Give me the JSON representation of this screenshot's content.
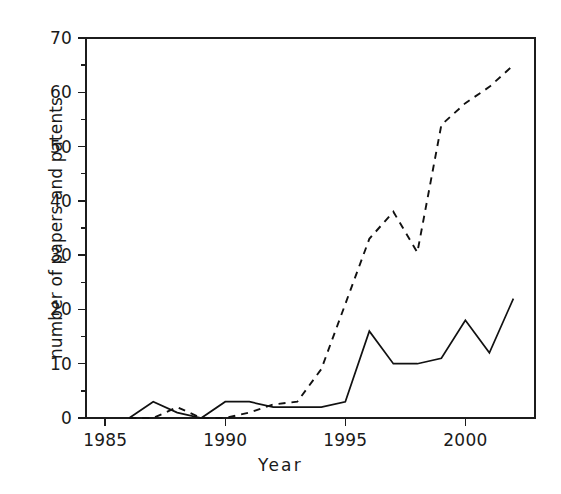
{
  "chart_data": {
    "type": "line",
    "title": "",
    "xlabel": "Year",
    "ylabel": "number of papers and patents",
    "xlim": [
      1984.2,
      2002.9
    ],
    "ylim": [
      0,
      70
    ],
    "grid": false,
    "legend": "none",
    "x_ticks": [
      1985,
      1990,
      1995,
      2000
    ],
    "x_tick_labels": [
      "1985",
      "1990",
      "1995",
      "2000"
    ],
    "x_minor_ticks": [],
    "y_ticks": [
      0,
      10,
      20,
      30,
      40,
      50,
      60,
      70
    ],
    "y_tick_labels": [
      "0",
      "10",
      "20",
      "30",
      "40",
      "50",
      "60",
      "70"
    ],
    "y_minor_ticks": [
      5,
      15,
      25,
      35,
      45,
      55,
      65
    ],
    "x": [
      1986,
      1987,
      1988,
      1989,
      1990,
      1991,
      1992,
      1993,
      1994,
      1995,
      1996,
      1997,
      1998,
      1999,
      2000,
      2001,
      2002
    ],
    "series": [
      {
        "name": "papers",
        "style": "solid",
        "color": "#111111",
        "values": [
          0,
          3,
          1,
          0,
          3,
          3,
          2,
          2,
          2,
          3,
          16,
          10,
          10,
          11,
          18,
          12,
          22
        ]
      },
      {
        "name": "patents",
        "style": "dashed",
        "color": "#111111",
        "values": [
          0,
          0,
          2,
          0,
          0,
          1,
          2.5,
          3,
          9,
          21,
          33,
          38,
          30.5,
          54,
          58,
          61,
          65
        ]
      }
    ]
  },
  "axes": {
    "x_title": "Year",
    "y_title": "number of papers and patents"
  },
  "colors": {
    "background": "#ffffff",
    "axis": "#1c1c1c",
    "line": "#111111"
  }
}
